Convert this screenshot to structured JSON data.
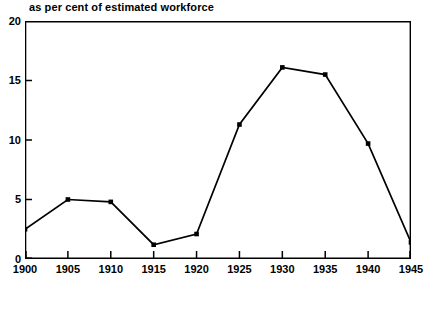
{
  "chart_data": {
    "type": "line",
    "title": "as per cent of estimated workforce",
    "subtitle": "",
    "xlabel": "",
    "ylabel": "",
    "categories": [
      "1900",
      "1905",
      "1910",
      "1915",
      "1920",
      "1925",
      "1930",
      "1935",
      "1940",
      "1945"
    ],
    "x": [
      1900,
      1905,
      1910,
      1915,
      1920,
      1925,
      1930,
      1935,
      1940,
      1945
    ],
    "values": [
      2.5,
      5.0,
      4.8,
      1.2,
      2.1,
      11.3,
      16.1,
      15.5,
      9.7,
      1.4
    ],
    "series": [
      {
        "name": "Unemployment as per cent of estimated workforce",
        "values": [
          2.5,
          5.0,
          4.8,
          1.2,
          2.1,
          11.3,
          16.1,
          15.5,
          9.7,
          1.4
        ]
      }
    ],
    "xlim": [
      1900,
      1945
    ],
    "ylim": [
      0,
      20
    ],
    "ytick_labels": [
      "0",
      "5",
      "10",
      "15",
      "20"
    ],
    "yticks": [
      0,
      5,
      10,
      15,
      20
    ],
    "xtick_labels": [
      "1900",
      "1905",
      "1910",
      "1915",
      "1920",
      "1925",
      "1930",
      "1935",
      "1940",
      "1945"
    ],
    "xticks": [
      1900,
      1905,
      1910,
      1915,
      1920,
      1925,
      1930,
      1935,
      1940,
      1945
    ],
    "grid": false,
    "legend": "none",
    "marker": "square",
    "line_color": "#000000",
    "marker_color": "#000000",
    "axis_color": "#000000",
    "background_color": "#ffffff",
    "tick_direction": "in"
  },
  "caption": {
    "text": "",
    "note": "illegible cropped scan text"
  }
}
